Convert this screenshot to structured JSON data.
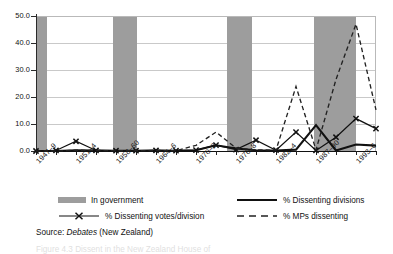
{
  "chart_data": {
    "type": "line",
    "title": "",
    "xlabel": "",
    "ylabel": "",
    "ylim": [
      0.0,
      50.0
    ],
    "ytick_labels": [
      "0.0",
      "10.0",
      "20.0",
      "30.0",
      "40.0",
      "50.0"
    ],
    "ytick_values": [
      0.0,
      10.0,
      20.0,
      30.0,
      40.0,
      50.0
    ],
    "grid": true,
    "legend_position": "below-axes",
    "x_tick_labels": [
      "1947–9",
      "1951–4",
      "1958–60",
      "1964–6",
      "1970–2",
      "1976–8",
      "1982–4",
      "1987–90",
      "1993–6"
    ],
    "x_index_of_labelled_ticks": [
      0,
      2,
      4,
      6,
      8,
      10,
      12,
      14,
      16
    ],
    "x": [
      0,
      1,
      2,
      3,
      4,
      5,
      6,
      7,
      8,
      9,
      10,
      11,
      12,
      13,
      14,
      15,
      16,
      17
    ],
    "series": [
      {
        "name": "% Dissenting divisions",
        "style": "solid",
        "color": "#111111",
        "values": [
          0.0,
          0.0,
          0.3,
          0.2,
          0.1,
          0.1,
          0.2,
          0.1,
          0.3,
          2.1,
          0.9,
          0.3,
          0.2,
          0.5,
          9.6,
          0.2,
          2.4,
          2.0
        ]
      },
      {
        "name": "% Dissenting votes/division",
        "style": "solid-x-markers",
        "color": "#111111",
        "values": [
          0.0,
          0.2,
          3.6,
          0.2,
          0.1,
          0.1,
          0.2,
          0.1,
          0.3,
          2.2,
          0.5,
          4.0,
          0.3,
          7.0,
          0.2,
          5.1,
          12.0,
          8.3
        ]
      },
      {
        "name": "% MPs dissenting",
        "style": "dashed",
        "color": "#222222",
        "values": [
          0.0,
          0.0,
          0.3,
          0.2,
          0.1,
          0.1,
          0.2,
          0.1,
          2.1,
          7.0,
          1.1,
          0.4,
          0.3,
          23.9,
          0.4,
          26.5,
          47.0,
          15.2
        ]
      }
    ],
    "bands": [
      {
        "label": "In government",
        "x_start": 0.0,
        "x_end": 0.55
      },
      {
        "label": "In government",
        "x_start": 3.85,
        "x_end": 5.05
      },
      {
        "label": "In government",
        "x_start": 9.55,
        "x_end": 10.8
      },
      {
        "label": "In government",
        "x_start": 13.9,
        "x_end": 16.0
      }
    ],
    "band_color": "#9d9d9d"
  },
  "legend": {
    "items": [
      {
        "label": "In government",
        "marker": "band-swatch"
      },
      {
        "label": "% Dissenting divisions",
        "marker": "solid-line"
      },
      {
        "label": "% Dissenting votes/division",
        "marker": "line-with-x-marker"
      },
      {
        "label": "% MPs dissenting",
        "marker": "dashed-line"
      }
    ]
  },
  "source": {
    "prefix": "Source: ",
    "emphasis": "Debates",
    "suffix": " (New Zealand)"
  },
  "caption": {
    "text": "Figure 4.3  Dissent in the New Zealand House of"
  }
}
